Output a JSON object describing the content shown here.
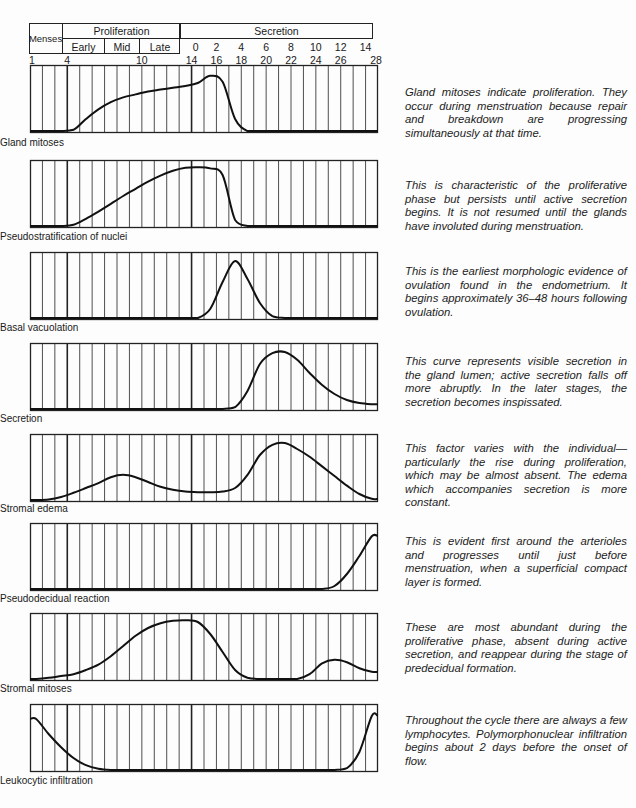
{
  "header": {
    "menses": "Menses",
    "proliferation": "Proliferation",
    "early": "Early",
    "mid": "Mid",
    "late": "Late",
    "secretion": "Secretion",
    "secretion_days": [
      "0",
      "2",
      "4",
      "6",
      "8",
      "10",
      "12",
      "14"
    ],
    "cycle_days_bottom": [
      "1",
      "4",
      "10",
      "14",
      "16",
      "18",
      "20",
      "22",
      "24",
      "26",
      "28"
    ]
  },
  "panels": [
    {
      "label": "Gland mitoses",
      "description": "Gland mitoses indicate proliferation. They occur during menstruation because repair and breakdown are progressing simultaneously at that time."
    },
    {
      "label": "Pseudostratification of nuclei",
      "description": "This is characteristic of the proliferative phase but persists until active secretion begins. It is not resumed until the glands have involuted during menstruation."
    },
    {
      "label": "Basal vacuolation",
      "description": "This is the earliest morphologic evidence of ovulation found in the endometrium. It begins approximately 36–48 hours following ovulation."
    },
    {
      "label": "Secretion",
      "description": "This curve represents visible secretion in the gland lumen; active secretion falls off more abruptly. In the later stages, the secretion becomes inspissated."
    },
    {
      "label": "Stromal edema",
      "description": "This factor varies with the individual—particularly the rise during proliferation, which may be almost absent. The edema which accompanies secretion is more constant."
    },
    {
      "label": "Pseudodecidual reaction",
      "description": "This is evident first around the arterioles and progresses until just before menstruation, when a superficial compact layer is formed."
    },
    {
      "label": "Stromal mitoses",
      "description": "These are most abundant during the proliferative phase, absent during active secretion, and reappear during the stage of predecidual formation."
    },
    {
      "label": "Leukocytic infiltration",
      "description": "Throughout the cycle there are always a few lymphocytes. Polymorphonuclear infiltration begins about 2 days before the onset of flow."
    }
  ],
  "footer_fragment": "… morphologic factors (Modified slightly after …",
  "chart_data": {
    "type": "line",
    "xlabel": "Day of cycle",
    "x": [
      1,
      2,
      3,
      4,
      5,
      6,
      7,
      8,
      9,
      10,
      11,
      12,
      13,
      14,
      15,
      16,
      17,
      18,
      19,
      20,
      21,
      22,
      23,
      24,
      25,
      26,
      27,
      28
    ],
    "xlim": [
      1,
      28
    ],
    "ylim": [
      0,
      1
    ],
    "phases": [
      {
        "name": "Menses",
        "days": [
          1,
          4
        ]
      },
      {
        "name": "Proliferation - Early",
        "days": [
          4,
          7
        ]
      },
      {
        "name": "Proliferation - Mid",
        "days": [
          7,
          10
        ]
      },
      {
        "name": "Proliferation - Late",
        "days": [
          10,
          14
        ]
      },
      {
        "name": "Secretion",
        "days": [
          14,
          28
        ],
        "post_ovulation_days": [
          0,
          14
        ]
      }
    ],
    "series": [
      {
        "name": "Gland mitoses",
        "values": [
          0,
          0,
          0,
          0.02,
          0.2,
          0.36,
          0.48,
          0.56,
          0.61,
          0.66,
          0.69,
          0.72,
          0.75,
          0.8,
          0.92,
          0.82,
          0.2,
          0,
          0,
          0,
          0,
          0,
          0,
          0,
          0,
          0,
          0,
          0
        ]
      },
      {
        "name": "Pseudostratification of nuclei",
        "values": [
          0,
          0,
          0,
          0.02,
          0.12,
          0.24,
          0.37,
          0.5,
          0.62,
          0.74,
          0.84,
          0.92,
          0.97,
          0.98,
          0.96,
          0.85,
          0.1,
          0,
          0,
          0,
          0,
          0,
          0,
          0,
          0,
          0,
          0,
          0
        ]
      },
      {
        "name": "Basal vacuolation",
        "values": [
          0,
          0,
          0,
          0,
          0,
          0,
          0,
          0,
          0,
          0,
          0,
          0,
          0,
          0,
          0.15,
          0.6,
          0.95,
          0.65,
          0.25,
          0.03,
          0,
          0,
          0,
          0,
          0,
          0,
          0,
          0
        ]
      },
      {
        "name": "Secretion",
        "values": [
          0,
          0,
          0,
          0,
          0,
          0,
          0,
          0,
          0,
          0,
          0,
          0,
          0,
          0,
          0,
          0,
          0.03,
          0.3,
          0.75,
          0.93,
          0.95,
          0.82,
          0.6,
          0.4,
          0.25,
          0.15,
          0.1,
          0.08
        ]
      },
      {
        "name": "Stromal edema",
        "values": [
          0,
          0.01,
          0.05,
          0.12,
          0.2,
          0.28,
          0.38,
          0.42,
          0.38,
          0.3,
          0.22,
          0.17,
          0.14,
          0.13,
          0.13,
          0.14,
          0.2,
          0.42,
          0.75,
          0.92,
          0.95,
          0.85,
          0.72,
          0.56,
          0.4,
          0.24,
          0.1,
          0.02
        ]
      },
      {
        "name": "Pseudodecidual reaction",
        "values": [
          0,
          0,
          0,
          0,
          0,
          0,
          0,
          0,
          0,
          0,
          0,
          0,
          0,
          0,
          0,
          0,
          0,
          0,
          0,
          0,
          0,
          0,
          0,
          0,
          0.05,
          0.25,
          0.55,
          0.88
        ]
      },
      {
        "name": "Stromal mitoses",
        "values": [
          0,
          0.02,
          0.05,
          0.08,
          0.15,
          0.24,
          0.38,
          0.55,
          0.72,
          0.85,
          0.93,
          0.97,
          0.98,
          0.95,
          0.75,
          0.45,
          0.15,
          0.02,
          0,
          0,
          0,
          0,
          0.08,
          0.26,
          0.32,
          0.28,
          0.18,
          0.12
        ]
      },
      {
        "name": "Leukocytic infiltration",
        "values": [
          0.85,
          0.6,
          0.38,
          0.2,
          0.08,
          0.02,
          0,
          0,
          0,
          0,
          0,
          0,
          0,
          0,
          0,
          0,
          0,
          0,
          0,
          0,
          0,
          0,
          0,
          0,
          0,
          0.03,
          0.3,
          0.9
        ]
      }
    ]
  }
}
